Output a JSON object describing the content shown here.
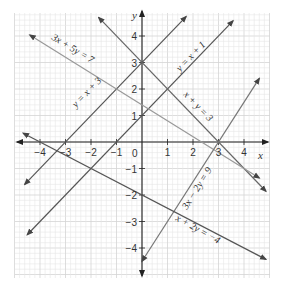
{
  "chart_data": {
    "type": "line",
    "title": "",
    "xlabel": "x",
    "ylabel": "y",
    "xlim": [
      -5,
      5
    ],
    "ylim": [
      -5,
      5
    ],
    "grid": true,
    "grid_minor_step": 0.2,
    "x_ticks": [
      -4,
      -3,
      -2,
      -1,
      0,
      1,
      2,
      3,
      4
    ],
    "x_tick_labels": [
      "−4",
      "−3",
      "−2",
      "−1",
      "0",
      "1",
      "2",
      "3",
      "4"
    ],
    "y_ticks": [
      -4,
      -3,
      -2,
      -1,
      1,
      2,
      3,
      4
    ],
    "y_tick_labels": [
      "−4",
      "−3",
      "−2",
      "−1",
      "1",
      "2",
      "3",
      "4"
    ],
    "series": [
      {
        "name": "y = x + 3",
        "equation": "y = x + 3",
        "x": [
          -4.6,
          1.73
        ],
        "y": [
          -1.6,
          4.73
        ],
        "color": "#555555"
      },
      {
        "name": "y = x + 1",
        "equation": "y = x + 1",
        "x": [
          -4.5,
          3.57
        ],
        "y": [
          -3.5,
          4.57
        ],
        "color": "#555555"
      },
      {
        "name": "x + y = 3",
        "equation": "x + y = 3",
        "x": [
          -1.7,
          4.86
        ],
        "y": [
          4.7,
          -1.86
        ],
        "color": "#666666"
      },
      {
        "name": "3x + 5y = 7",
        "equation": "3x + 5y = 7",
        "x": [
          -4.4,
          4.6
        ],
        "y": [
          4.04,
          -1.36
        ],
        "color": "#999999"
      },
      {
        "name": "3x − 2y = 9",
        "equation": "3x − 2y = 9",
        "x": [
          0.0,
          4.6
        ],
        "y": [
          -4.5,
          2.4
        ],
        "color": "#777777"
      },
      {
        "name": "x + 2y = −4",
        "equation": "x + 2y = −4",
        "x": [
          -4.66,
          4.86
        ],
        "y": [
          0.33,
          -4.43
        ],
        "color": "#555555"
      }
    ]
  },
  "labels": {
    "x_axis": "x",
    "y_axis": "y",
    "eq1": "y = x + 3",
    "eq2": "y = x + 1",
    "eq3": "x + y = 3",
    "eq4": "3x + 5y = 7",
    "eq5": "3x − 2y = 9",
    "eq6": "x + 2y = −4",
    "origin": "0"
  }
}
